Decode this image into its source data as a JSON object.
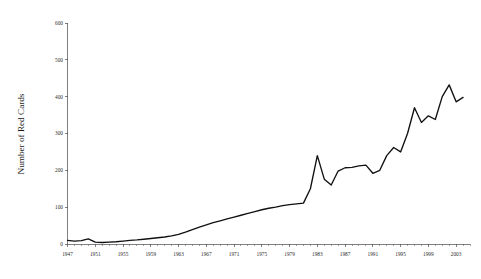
{
  "chart_data": {
    "type": "line",
    "title": "",
    "xlabel": "",
    "ylabel": "Number of Red Cards",
    "xlim": [
      1947,
      2005
    ],
    "ylim": [
      0,
      600
    ],
    "grid": false,
    "legend": null,
    "series_color": "#111111",
    "background_color": "#ffffff",
    "y_ticks": [
      0,
      100,
      200,
      300,
      400,
      500,
      600
    ],
    "y_tick_labels": [
      "0",
      "100",
      "200",
      "300",
      "400",
      "500",
      "600"
    ],
    "x_ticks": [
      1947,
      1951,
      1955,
      1959,
      1963,
      1967,
      1971,
      1975,
      1979,
      1983,
      1987,
      1991,
      1995,
      1999,
      2003
    ],
    "x_tick_labels": [
      "1947",
      "1951",
      "1955",
      "1959",
      "1963",
      "1967",
      "1971",
      "1975",
      "1979",
      "1983",
      "1987",
      "1991",
      "1995",
      "1999",
      "2003"
    ],
    "x_minor_tick_step": 1,
    "x": [
      1947,
      1948,
      1949,
      1950,
      1951,
      1952,
      1953,
      1954,
      1955,
      1956,
      1957,
      1958,
      1959,
      1960,
      1961,
      1962,
      1963,
      1964,
      1965,
      1966,
      1967,
      1968,
      1969,
      1970,
      1971,
      1972,
      1973,
      1974,
      1975,
      1976,
      1977,
      1978,
      1979,
      1980,
      1981,
      1982,
      1983,
      1984,
      1985,
      1986,
      1987,
      1988,
      1989,
      1990,
      1991,
      1992,
      1993,
      1994,
      1995,
      1996,
      1997,
      1998,
      1999,
      2000,
      2001,
      2002,
      2003,
      2004
    ],
    "values": [
      10,
      8,
      9,
      14,
      5,
      4,
      5,
      6,
      8,
      10,
      11,
      13,
      15,
      17,
      19,
      22,
      26,
      32,
      39,
      46,
      52,
      58,
      63,
      68,
      73,
      78,
      83,
      88,
      93,
      97,
      100,
      104,
      107,
      109,
      111,
      150,
      240,
      176,
      160,
      198,
      207,
      208,
      212,
      214,
      192,
      200,
      240,
      262,
      250,
      300,
      370,
      330,
      348,
      338,
      400,
      432,
      386,
      398
    ],
    "annotations": []
  },
  "chart_meta": {
    "series_name": "Number of Red Cards"
  }
}
